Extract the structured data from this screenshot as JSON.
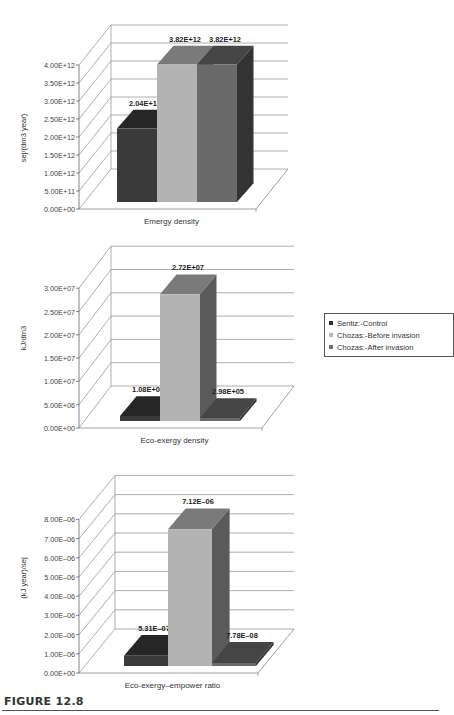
{
  "figure": {
    "label": "FIGURE 12.8"
  },
  "legend": {
    "items": [
      {
        "label": "Sentiz:-Control",
        "color": "#2e2e2e"
      },
      {
        "label": "Chozas:-Before invasion",
        "color": "#b8b8b8"
      },
      {
        "label": "Chozas:-After invasion",
        "color": "#6e6e6e"
      }
    ]
  },
  "colors": {
    "series_front": [
      "#3a3a3a",
      "#b3b3b3",
      "#6a6a6a"
    ],
    "series_top": [
      "#262626",
      "#7a7a7a",
      "#454545"
    ],
    "series_side": [
      "#1e1e1e",
      "#5a5a5a",
      "#333333"
    ],
    "grid": "#9a9a9a"
  },
  "chart_data": [
    {
      "type": "bar",
      "title": "",
      "xlabel": "Emergy density",
      "ylabel": "sej/(dm3 year)",
      "categories": [
        "Emergy density"
      ],
      "series": [
        {
          "name": "Sentiz:-Control",
          "values": [
            2040000000000.0
          ],
          "label": "2.04E+12"
        },
        {
          "name": "Chozas:-Before invasion",
          "values": [
            3820000000000.0
          ],
          "label": "3.82E+12"
        },
        {
          "name": "Chozas:-After invasion",
          "values": [
            3820000000000.0
          ],
          "label": "3.82E+12"
        }
      ],
      "yticks": [
        "0.00E+00",
        "5.00E+11",
        "1.00E+12",
        "1.50E+12",
        "2.00E+12",
        "2.50E+12",
        "3.00E+12",
        "3.50E+12",
        "4.00E+12"
      ],
      "ylim": [
        0,
        4000000000000.0
      ],
      "grid": true,
      "legend_position": "right"
    },
    {
      "type": "bar",
      "title": "",
      "xlabel": "Eco-exergy density",
      "ylabel": "kJ/dm3",
      "categories": [
        "Eco-exergy density"
      ],
      "series": [
        {
          "name": "Sentiz:-Control",
          "values": [
            1080000.0
          ],
          "label": "1.08E+06"
        },
        {
          "name": "Chozas:-Before invasion",
          "values": [
            27200000.0
          ],
          "label": "2.72E+07"
        },
        {
          "name": "Chozas:-After invasion",
          "values": [
            298000.0
          ],
          "label": "2.98E+05"
        }
      ],
      "yticks": [
        "0.00E+00",
        "5.00E+06",
        "1.00E+07",
        "1.50E+07",
        "2.00E+07",
        "2.50E+07",
        "3.00E+07"
      ],
      "ylim": [
        0,
        30000000.0
      ],
      "grid": true,
      "legend_position": "right"
    },
    {
      "type": "bar",
      "title": "",
      "xlabel": "Eco-exergy–empower ratio",
      "ylabel": "(kJ year)/sej",
      "categories": [
        "Eco-exergy–empower ratio"
      ],
      "series": [
        {
          "name": "Sentiz:-Control",
          "values": [
            5.31e-07
          ],
          "label": "5.31E–07"
        },
        {
          "name": "Chozas:-Before invasion",
          "values": [
            7.12e-06
          ],
          "label": "7.12E–06"
        },
        {
          "name": "Chozas:-After invasion",
          "values": [
            7.78e-08
          ],
          "label": "7.78E–08"
        }
      ],
      "yticks": [
        "0.00E+00",
        "1.00E–06",
        "2.00E–06",
        "3.00E–06",
        "4.00E–06",
        "5.00E–06",
        "6.00E–06",
        "7.00E–06",
        "8.00E–06"
      ],
      "ylim": [
        0,
        8e-06
      ],
      "grid": true,
      "legend_position": "right"
    }
  ]
}
